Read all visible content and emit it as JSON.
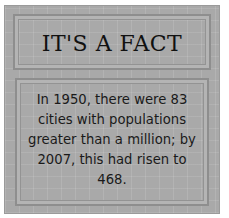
{
  "card": {
    "title": "IT'S A FACT",
    "fact_text": "In 1950, there were 83 cities with populations greater than a million; by 2007, this had risen to 468.",
    "colors": {
      "background": "#a9a9a9",
      "border": "#8e8e8e",
      "text": "#111111"
    }
  }
}
